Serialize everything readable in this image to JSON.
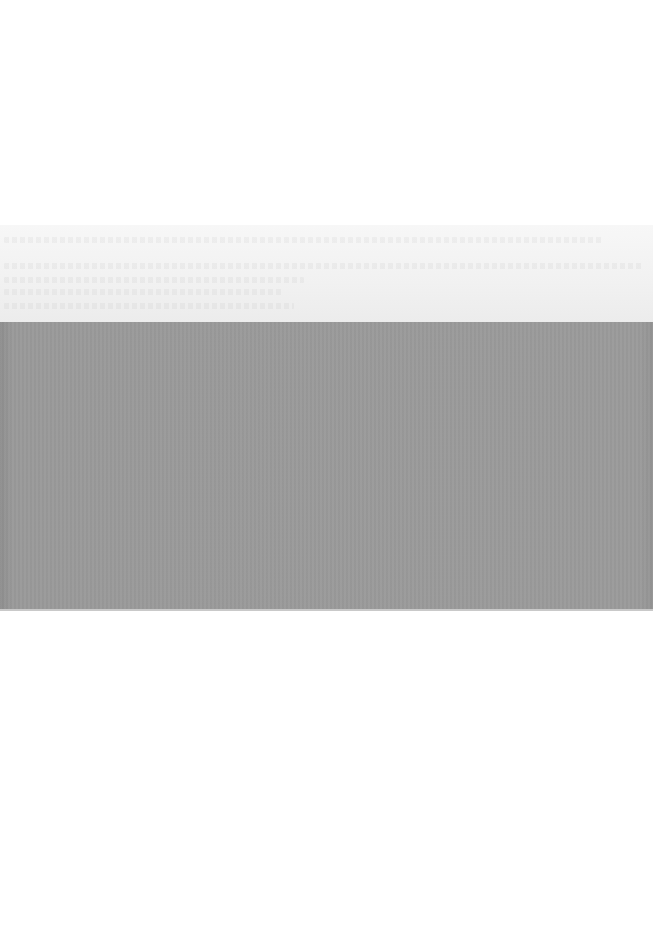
{
  "document": {
    "type": "scanned-page",
    "legible_text": [],
    "regions": {
      "top_margin": {
        "y": 0,
        "height": 225,
        "color": "#ffffff"
      },
      "faint_text_band": {
        "y": 225,
        "height": 97,
        "color": "#f1f1f1",
        "text_visible": false,
        "note": ""
      },
      "gray_block": {
        "y": 322,
        "height": 288,
        "color": "#999999"
      },
      "bottom_margin": {
        "y": 611,
        "height": 340,
        "color": "#ffffff"
      }
    }
  }
}
